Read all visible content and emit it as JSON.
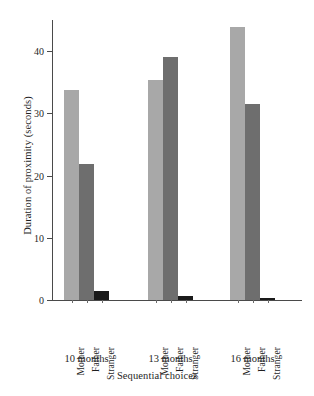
{
  "chart_data": {
    "type": "bar",
    "title": "",
    "subtitle": "",
    "xlabel": "Sequential choices",
    "ylabel": "Duration of proximity (seconds)",
    "categories": [
      "10 months",
      "13 months",
      "16 months"
    ],
    "group_inner_labels": [
      "Mother",
      "Father",
      "Stranger"
    ],
    "series": [
      {
        "name": "Mother",
        "values": [
          33.8,
          35.3,
          43.8
        ],
        "color": "#a8a8a8"
      },
      {
        "name": "Father",
        "values": [
          21.8,
          39.0,
          31.5
        ],
        "color": "#6e6e6e"
      },
      {
        "name": "Stranger",
        "values": [
          1.5,
          0.6,
          0.4
        ],
        "color": "#1a1a1a"
      }
    ],
    "ylim": [
      0,
      45
    ],
    "yticks": [
      0,
      10,
      20,
      30,
      40
    ],
    "ytick_labels": [
      "0",
      "10",
      "20",
      "30",
      "40"
    ],
    "grid": false,
    "legend": "none",
    "axis_color": "#4a4a4a",
    "background": "#ffffff"
  }
}
